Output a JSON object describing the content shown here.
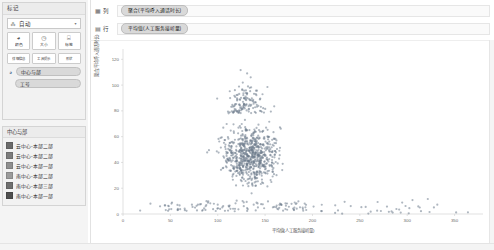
{
  "marks_card": {
    "title": "标记",
    "mark_type": {
      "icon": "automatic-mark-icon",
      "label": "自动",
      "caret": "▾"
    },
    "buttons": [
      {
        "icon": "color-icon",
        "glyph": "◕",
        "label": "颜色"
      },
      {
        "icon": "size-icon",
        "glyph": "◔",
        "label": "大小"
      },
      {
        "icon": "label-icon",
        "glyph": "T",
        "label": "标签"
      }
    ],
    "buttons_row2": [
      {
        "icon": "detail-icon",
        "label": "详细信息"
      },
      {
        "icon": "tooltip-icon",
        "label": "工具提示"
      },
      {
        "icon": "shape-icon",
        "label": "形状"
      }
    ],
    "encoding_pills": [
      {
        "icon": "color-encoding-icon",
        "label": "中心与部"
      },
      {
        "icon": "",
        "label": "工号"
      }
    ]
  },
  "legend": {
    "title": "中心与部",
    "items": [
      {
        "label": "云中心-本部二部",
        "color": "#6b6b6b"
      },
      {
        "label": "云中心-本部二部",
        "color": "#7d7d7d"
      },
      {
        "label": "云中心-本部一部",
        "color": "#8f8f8f"
      },
      {
        "label": "南中心-本部二部",
        "color": "#9b9b9b"
      },
      {
        "label": "南中心-本部三部",
        "color": "#6f6f6f"
      },
      {
        "label": "南中心-本部一部",
        "color": "#4f4f4f"
      }
    ]
  },
  "shelves": [
    {
      "name": "列",
      "glyph": "▦",
      "pill": "聚合(平均呼入通话时长)"
    },
    {
      "name": "行",
      "glyph": "▤",
      "pill": "平均值(人工服务接听量)"
    }
  ],
  "chart_data": {
    "type": "scatter",
    "title": "",
    "xlabel": "平均值(人工服务接听量)",
    "ylabel": "聚合(平均呼入通话时长)",
    "xlim": [
      0,
      380
    ],
    "ylim": [
      0,
      128
    ],
    "xticks": [
      0,
      50,
      100,
      150,
      200,
      250,
      300,
      350
    ],
    "yticks": [
      0,
      20,
      40,
      60,
      80,
      100,
      120
    ],
    "grid": false,
    "legend_position": "left",
    "point_color": "#6e7b8c",
    "point_opacity": 0.55,
    "point_radius": 1.1,
    "series": [
      {
        "name": "中心与部",
        "description": "密集散点云，主体集中于 x≈95-175, y≈15-75，并有长尾延伸至 x≈360",
        "n_points": 980,
        "cluster": {
          "core_x_range": [
            95,
            175
          ],
          "core_y_range": [
            12,
            80
          ],
          "tail_x_range": [
            175,
            365
          ],
          "baseline_y": 2
        }
      }
    ]
  }
}
